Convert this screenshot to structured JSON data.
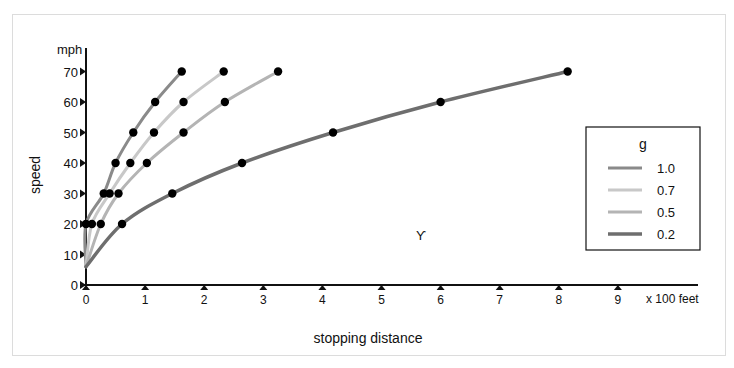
{
  "chart_data": {
    "type": "line",
    "title": "",
    "xlabel": "stopping distance",
    "x_unit": "x 100 feet",
    "ylabel": "speed",
    "y_unit": "mph",
    "xlim": [
      0,
      10
    ],
    "ylim": [
      0,
      75
    ],
    "x_ticks": [
      "0",
      "1",
      "2",
      "3",
      "4",
      "5",
      "6",
      "7",
      "8",
      "9"
    ],
    "y_ticks": [
      "0",
      "10",
      "20",
      "30",
      "40",
      "50",
      "60",
      "70"
    ],
    "grid": false,
    "legend_title": "g",
    "legend_position": "right",
    "series": [
      {
        "name": "1.0",
        "color": "#8a8a8a",
        "width": 3,
        "points": [
          [
            0.0,
            20
          ],
          [
            0.3,
            30
          ],
          [
            0.5,
            40
          ],
          [
            0.8,
            50
          ],
          [
            1.17,
            60
          ],
          [
            1.62,
            70
          ]
        ]
      },
      {
        "name": "0.7",
        "color": "#c8c8c8",
        "width": 3,
        "points": [
          [
            0.1,
            20
          ],
          [
            0.4,
            30
          ],
          [
            0.75,
            40
          ],
          [
            1.15,
            50
          ],
          [
            1.65,
            60
          ],
          [
            2.33,
            70
          ]
        ]
      },
      {
        "name": "0.5",
        "color": "#b4b4b4",
        "width": 3,
        "points": [
          [
            0.25,
            20
          ],
          [
            0.55,
            30
          ],
          [
            1.03,
            40
          ],
          [
            1.65,
            50
          ],
          [
            2.35,
            60
          ],
          [
            3.25,
            70
          ]
        ]
      },
      {
        "name": "0.2",
        "color": "#6e6e6e",
        "width": 3.5,
        "points": [
          [
            0.61,
            20
          ],
          [
            1.46,
            30
          ],
          [
            2.64,
            40
          ],
          [
            4.18,
            50
          ],
          [
            6.0,
            60
          ],
          [
            8.15,
            70
          ]
        ]
      }
    ]
  },
  "labels": {
    "ylabel": "speed",
    "yunit": "mph",
    "xlabel": "stopping distance",
    "xunit": "x 100 feet",
    "legend_title": "g",
    "legend_items": [
      "1.0",
      "0.7",
      "0.5",
      "0.2"
    ],
    "stray_mark": "ϒ"
  }
}
